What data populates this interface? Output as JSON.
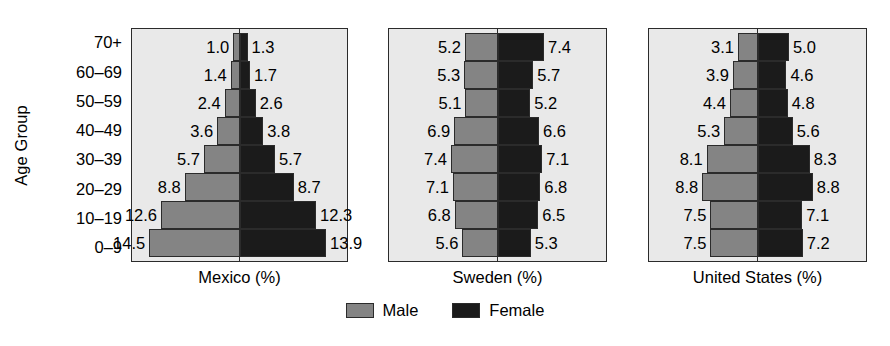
{
  "chart_data": {
    "type": "bar",
    "subtype": "population-pyramid",
    "title": "",
    "xlabel": "",
    "ylabel": "Age Group",
    "categories": [
      "70+",
      "60–69",
      "50–59",
      "40–49",
      "30–39",
      "20–29",
      "10–19",
      "0–9"
    ],
    "legend": {
      "position": "bottom-center",
      "entries": [
        {
          "name": "Male",
          "color": "#848484"
        },
        {
          "name": "Female",
          "color": "#1b1b1b"
        }
      ]
    },
    "grid": false,
    "value_units": "%",
    "max_value": 14.5,
    "panels": [
      {
        "name": "mexico",
        "caption": "Mexico (%)",
        "series": [
          {
            "name": "Male",
            "values": [
              1.0,
              1.4,
              2.4,
              3.6,
              5.7,
              8.8,
              12.6,
              14.5
            ]
          },
          {
            "name": "Female",
            "values": [
              1.3,
              1.7,
              2.6,
              3.8,
              5.7,
              8.7,
              12.3,
              13.9
            ]
          }
        ]
      },
      {
        "name": "sweden",
        "caption": "Sweden (%)",
        "series": [
          {
            "name": "Male",
            "values": [
              5.2,
              5.3,
              5.1,
              6.9,
              7.4,
              7.1,
              6.8,
              5.6
            ]
          },
          {
            "name": "Female",
            "values": [
              7.4,
              5.7,
              5.2,
              6.6,
              7.1,
              6.8,
              6.5,
              5.3
            ]
          }
        ]
      },
      {
        "name": "united-states",
        "caption": "United States (%)",
        "series": [
          {
            "name": "Male",
            "values": [
              3.1,
              3.9,
              4.4,
              5.3,
              8.1,
              8.8,
              7.5,
              7.5
            ]
          },
          {
            "name": "Female",
            "values": [
              5.0,
              4.6,
              4.8,
              5.6,
              8.3,
              8.8,
              7.1,
              7.2
            ]
          }
        ]
      }
    ]
  },
  "axis": {
    "y_title": "Age Group",
    "tick_labels": [
      "70+",
      "60–69",
      "50–59",
      "40–49",
      "30–39",
      "20–29",
      "10–19",
      "0–9"
    ]
  },
  "panels": {
    "mexico": {
      "caption": "Mexico (%)"
    },
    "sweden": {
      "caption": "Sweden (%)"
    },
    "united_states": {
      "caption": "United States (%)"
    }
  },
  "legend": {
    "male_label": "Male",
    "female_label": "Female"
  },
  "colors": {
    "male": "#848484",
    "female": "#1b1b1b",
    "panel_background": "#e9e9e9",
    "outline": "#2b2b2b",
    "page_background": "#ffffff"
  }
}
